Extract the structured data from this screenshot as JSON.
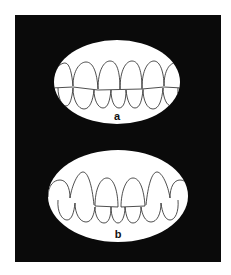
{
  "figure": {
    "background": "#0a0a0a",
    "panels": [
      {
        "id": "a",
        "label": "a",
        "description": "Dentition with even, rounded upper teeth"
      },
      {
        "id": "b",
        "label": "b",
        "description": "Dentition with pointed, uneven upper teeth"
      }
    ]
  }
}
